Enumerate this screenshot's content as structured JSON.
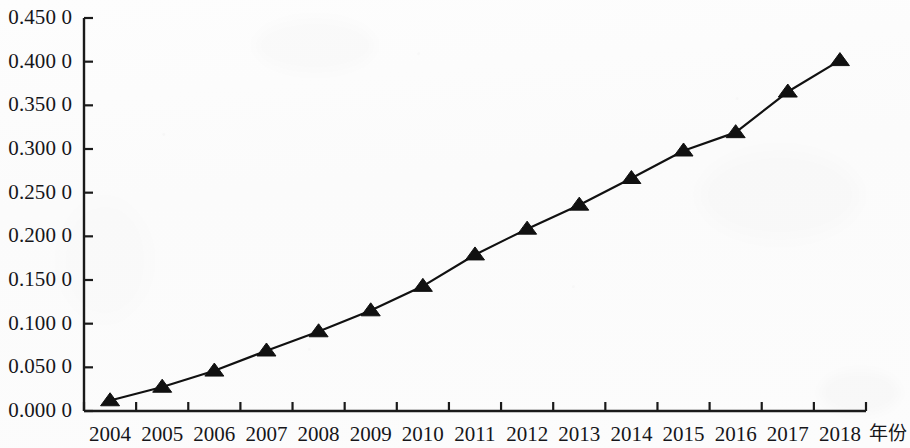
{
  "chart_data": {
    "type": "line",
    "title": "",
    "subtitle": "",
    "xlabel": "年份",
    "ylabel": "",
    "categories": [
      "2004",
      "2005",
      "2006",
      "2007",
      "2008",
      "2009",
      "2010",
      "2011",
      "2012",
      "2013",
      "2014",
      "2015",
      "2016",
      "2017",
      "2018"
    ],
    "values": [
      0.012,
      0.0275,
      0.046,
      0.069,
      0.091,
      0.115,
      0.143,
      0.179,
      0.2085,
      0.236,
      0.2665,
      0.298,
      0.319,
      0.3655,
      0.4015
    ],
    "series": [
      {
        "name": "",
        "values": [
          0.012,
          0.0275,
          0.046,
          0.069,
          0.091,
          0.115,
          0.143,
          0.179,
          0.2085,
          0.236,
          0.2665,
          0.298,
          0.319,
          0.3655,
          0.4015
        ]
      }
    ],
    "ylim": [
      0.0,
      0.45
    ],
    "ytick_values": [
      0.0,
      0.05,
      0.1,
      0.15,
      0.2,
      0.25,
      0.3,
      0.35,
      0.4,
      0.45
    ],
    "ytick_labels": [
      "0.000 0",
      "0.050 0",
      "0.100 0",
      "0.150 0",
      "0.200 0",
      "0.250 0",
      "0.300 0",
      "0.350 0",
      "0.400 0",
      "0.450 0"
    ],
    "xtick_labels": [
      "2004",
      "2005",
      "2006",
      "2007",
      "2008",
      "2009",
      "2010",
      "2011",
      "2012",
      "2013",
      "2014",
      "2015",
      "2016",
      "2017",
      "2018"
    ],
    "grid": false,
    "legend": null,
    "legend_position": "none",
    "marker": "triangle",
    "line_color": "#111111",
    "marker_color": "#111111",
    "axis_color": "#1a1a1a",
    "background_color": "#fcfcfc",
    "annotations": []
  },
  "axes": {
    "y_axis_name": "",
    "x_axis_name": "年份"
  }
}
